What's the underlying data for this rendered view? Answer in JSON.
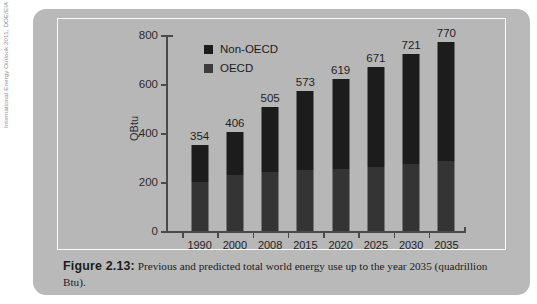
{
  "source_credit": "International Energy Outlook 2011, DOE/EIA",
  "caption": {
    "label": "Figure 2.13:",
    "text": " Previous and predicted total world energy use up to the year 2035 (quadrillion Btu)."
  },
  "colors": {
    "page_background": "#ffffff",
    "panel_background": "#b9b9b9",
    "chart_background": "#b7b7b7",
    "chart_border": "#fbfbfb",
    "axis": "#4a4a4a",
    "non_oecd": "#1c1c1c",
    "oecd": "#343434",
    "text": "#1f1f1f"
  },
  "chart_data": {
    "type": "bar",
    "stacked": true,
    "title": "",
    "xlabel": "",
    "ylabel": "QBtu",
    "ylim": [
      0,
      800
    ],
    "yticks": [
      0,
      200,
      400,
      600,
      800
    ],
    "ytick_labels": [
      "0",
      "200",
      "400",
      "600",
      "800"
    ],
    "grid": false,
    "legend_position": "top-left",
    "categories": [
      "1990",
      "2000",
      "2008",
      "2015",
      "2020",
      "2025",
      "2030",
      "2035"
    ],
    "series": [
      {
        "name": "OECD",
        "values": [
          200,
          229,
          244,
          250,
          254,
          261,
          275,
          285
        ]
      },
      {
        "name": "Non-OECD",
        "values": [
          154,
          177,
          261,
          323,
          365,
          410,
          446,
          485
        ]
      }
    ],
    "totals": [
      354,
      406,
      505,
      573,
      619,
      671,
      721,
      770
    ],
    "data_labels": [
      "354",
      "406",
      "505",
      "573",
      "619",
      "671",
      "721",
      "770"
    ]
  }
}
